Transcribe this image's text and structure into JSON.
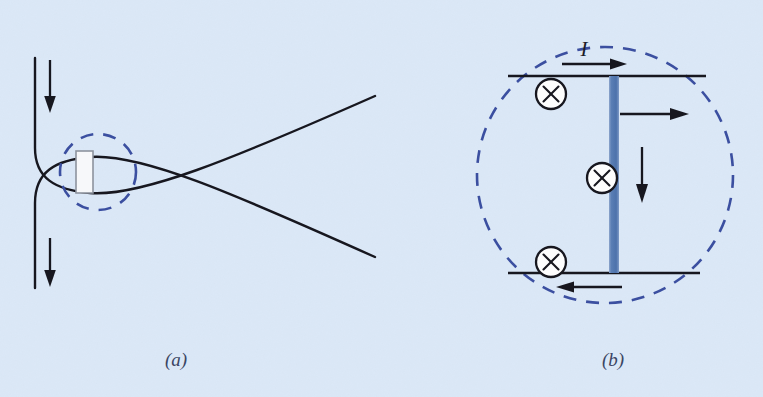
{
  "figure": {
    "background_color": "#dbe8f7",
    "ink_color": "#17171f",
    "dashed_circle_color": "#3b4fa0",
    "current_sheet_color": "#5b7fb5",
    "caption_color": "#3a4563",
    "width": 763,
    "height": 397
  },
  "panel_a": {
    "caption": "(a)",
    "caption_x": 176,
    "caption_y": 366,
    "description": "X-point magnetic reconnection geometry with inflow arrows and a dashed circle marking the diffusion region containing a thin current sheet",
    "elements": {
      "inflow_top_label": "inflow-arrow-top",
      "inflow_bottom_label": "inflow-arrow-bottom",
      "diffusion_region_label": "dashed-diffusion-circle",
      "current_sheet_label": "current-sheet-rectangle",
      "separatrix_upper_label": "separatrix-upper",
      "separatrix_lower_label": "separatrix-lower"
    },
    "dashed_circle": {
      "cx": 98,
      "cy": 172,
      "r": 38
    },
    "sheet_rect": {
      "x": 76,
      "y": 151,
      "width": 17,
      "height": 42
    }
  },
  "panel_b": {
    "caption": "(b)",
    "caption_x": 613,
    "caption_y": 366,
    "current_label": "I",
    "current_label_x": 584,
    "current_label_y": 56,
    "description": "Blow-up of the diffusion region showing the current sheet, the current direction I, antiparallel field lines and out-of-plane current crosses",
    "dashed_circle": {
      "cx": 605,
      "cy": 175,
      "r": 128
    },
    "current_sheet": {
      "x": 609,
      "y": 76,
      "width": 10,
      "height": 197
    },
    "field_lines": [
      {
        "name": "field-line-top",
        "x1": 508,
        "x2": 706,
        "y": 76
      },
      {
        "name": "field-line-bottom",
        "x1": 508,
        "x2": 700,
        "y": 273
      }
    ],
    "cross_symbols": [
      {
        "name": "current-cross-top",
        "cx": 551,
        "cy": 94,
        "r": 15
      },
      {
        "name": "current-cross-middle",
        "cx": 602,
        "cy": 178,
        "r": 15
      },
      {
        "name": "current-cross-bottom",
        "cx": 551,
        "cy": 262,
        "r": 15
      }
    ],
    "arrows": [
      {
        "name": "current-direction-arrow",
        "direction": "right",
        "x1": 562,
        "y1": 64,
        "x2": 625,
        "y2": 64
      },
      {
        "name": "outflow-arrow-right",
        "direction": "right",
        "x1": 619,
        "y1": 114,
        "x2": 687,
        "y2": 114
      },
      {
        "name": "field-reversal-arrow-down",
        "direction": "down",
        "x1": 642,
        "y1": 147,
        "x2": 642,
        "y2": 199
      },
      {
        "name": "field-line-bottom-arrow",
        "direction": "left",
        "x1": 622,
        "y1": 287,
        "x2": 558,
        "y2": 287
      }
    ]
  }
}
